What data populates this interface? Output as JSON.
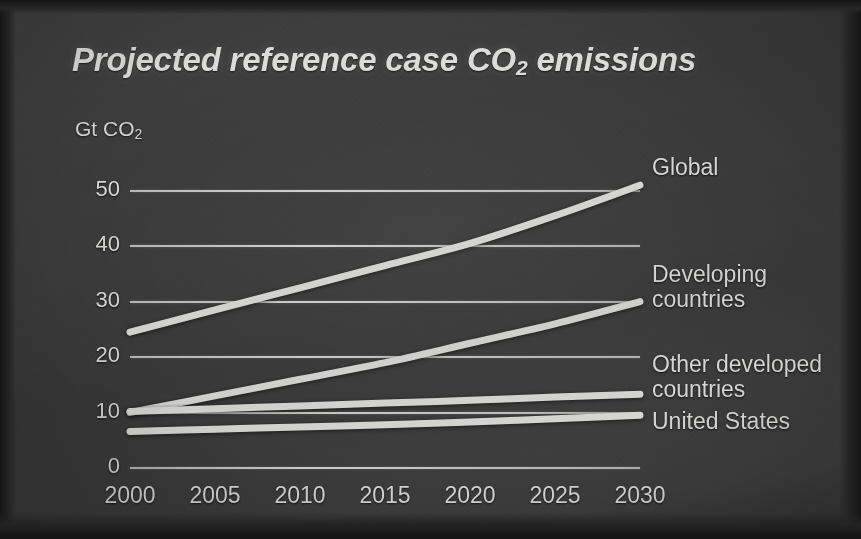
{
  "slide": {
    "title_main": "Projected reference case CO",
    "title_sub": "2",
    "title_tail": " emissions",
    "background_color": "#3a3a3a",
    "ink_color": "#d9d9d6"
  },
  "chart_data": {
    "type": "line",
    "title": "Projected reference case CO2 emissions",
    "xlabel": "",
    "ylabel": "Gt CO2",
    "unit_label_main": "Gt CO",
    "unit_label_sub": "2",
    "x": [
      2000,
      2005,
      2010,
      2015,
      2020,
      2025,
      2030
    ],
    "categories": [
      "2000",
      "2005",
      "2010",
      "2015",
      "2020",
      "2025",
      "2030"
    ],
    "xlim": [
      2000,
      2030
    ],
    "ylim": [
      0,
      55
    ],
    "yticks": [
      50,
      40,
      30,
      20,
      10,
      0
    ],
    "ytick_labels": [
      "50",
      "40",
      "30",
      "20",
      "10",
      "0"
    ],
    "grid": true,
    "grid_axis": "y",
    "legend_position": "right-inline-labels",
    "series": [
      {
        "name": "Global",
        "label": "Global",
        "values": [
          24.5,
          28.5,
          32.5,
          36.5,
          40.5,
          45.5,
          51.0
        ]
      },
      {
        "name": "Developing countries",
        "label": "Developing\ncountries",
        "values": [
          10.0,
          13.0,
          16.0,
          19.0,
          22.5,
          26.0,
          30.0
        ]
      },
      {
        "name": "Other developed countries",
        "label": "Other developed\ncountries",
        "values": [
          10.2,
          10.7,
          11.2,
          11.7,
          12.2,
          12.8,
          13.3
        ]
      },
      {
        "name": "United States",
        "label": "United States",
        "values": [
          6.6,
          7.0,
          7.4,
          7.8,
          8.3,
          8.9,
          9.5
        ]
      }
    ]
  }
}
